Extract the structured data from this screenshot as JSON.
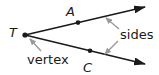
{
  "diagram": {
    "points": {
      "vertex": {
        "label": "T",
        "x": 25,
        "y": 35
      },
      "upper": {
        "label": "A",
        "x": 78,
        "y": 22
      },
      "lower": {
        "label": "C",
        "x": 90,
        "y": 52
      }
    },
    "rays": [
      {
        "from": "T",
        "through": "A"
      },
      {
        "from": "T",
        "through": "C"
      }
    ],
    "annotations": {
      "sides_label": "sides",
      "vertex_label": "vertex"
    },
    "colors": {
      "ray": "#1a1a1a",
      "pointer": "#9a9a9a",
      "text": "#1a1a1a"
    }
  }
}
